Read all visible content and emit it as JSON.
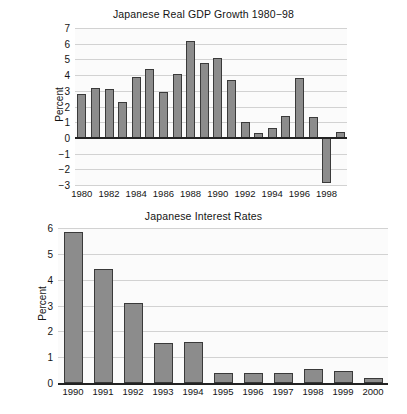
{
  "figure": {
    "ylabel": "Percent"
  },
  "chart_data": [
    {
      "type": "bar",
      "title": "Japanese Real GDP Growth 1980−98",
      "xlabel": "",
      "ylabel": "Percent",
      "ylim": [
        -3,
        7
      ],
      "yticks": [
        7,
        6,
        5,
        4,
        3,
        2,
        1,
        0,
        -1,
        -2,
        -3
      ],
      "ytick_labels": [
        "7",
        "6",
        "5",
        "4",
        "3",
        "2",
        "1",
        "0",
        "−1",
        "−2",
        "−3"
      ],
      "xtick_labels": [
        "1980",
        "1982",
        "1984",
        "1986",
        "1988",
        "1990",
        "1992",
        "1994",
        "1996",
        "1998"
      ],
      "grid": true,
      "legend": "none",
      "bar_color": "#8c8c8c",
      "bar_edge_color": "#3a3a3a",
      "categories": [
        "1980",
        "1981",
        "1982",
        "1983",
        "1984",
        "1985",
        "1986",
        "1987",
        "1988",
        "1989",
        "1990",
        "1991",
        "1992",
        "1993",
        "1994",
        "1995",
        "1996",
        "1997",
        "1998",
        "1999"
      ],
      "values": [
        2.8,
        3.2,
        3.1,
        2.3,
        3.9,
        4.4,
        2.9,
        4.1,
        6.2,
        4.8,
        5.1,
        3.7,
        1.0,
        0.3,
        0.6,
        1.4,
        3.8,
        1.3,
        -2.9,
        0.4
      ]
    },
    {
      "type": "bar",
      "title": "Japanese Interest Rates",
      "xlabel": "",
      "ylabel": "Percent",
      "ylim": [
        0,
        6
      ],
      "yticks": [
        6,
        5,
        4,
        3,
        2,
        1,
        0
      ],
      "ytick_labels": [
        "6",
        "5",
        "4",
        "3",
        "2",
        "1",
        "0"
      ],
      "xtick_labels": [
        "1990",
        "1991",
        "1992",
        "1993",
        "1994",
        "1995",
        "1996",
        "1997",
        "1998",
        "1999",
        "2000"
      ],
      "grid": true,
      "legend": "none",
      "bar_color": "#8c8c8c",
      "bar_edge_color": "#3a3a3a",
      "categories": [
        "1990",
        "1991",
        "1992",
        "1993",
        "1994",
        "1995",
        "1996",
        "1997",
        "1998",
        "1999",
        "2000"
      ],
      "values": [
        5.85,
        4.4,
        3.1,
        1.55,
        1.6,
        0.4,
        0.4,
        0.4,
        0.55,
        0.45,
        0.2
      ]
    }
  ]
}
